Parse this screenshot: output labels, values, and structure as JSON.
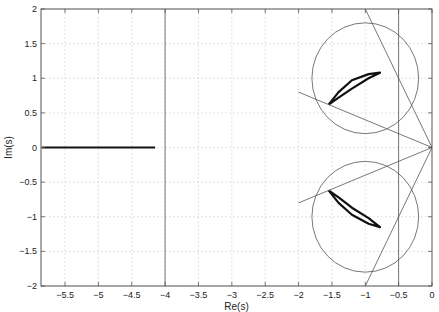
{
  "chart_data": {
    "type": "line",
    "title": "",
    "xlabel": "Re(s)",
    "ylabel": "Im(s)",
    "xlim": [
      -5.86,
      0
    ],
    "ylim": [
      -2,
      2
    ],
    "grid": true,
    "legend": null,
    "x_ticks": [
      -5.5,
      -5,
      -4.5,
      -4,
      -3.5,
      -3,
      -2.5,
      -2,
      -1.5,
      -1,
      -0.5,
      0
    ],
    "x_tick_labels": [
      "-5.5",
      "-5",
      "-4.5",
      "-4",
      "-3.5",
      "-3",
      "-2.5",
      "-2",
      "-1.5",
      "-1",
      "-0.5",
      "0"
    ],
    "y_ticks": [
      -2,
      -1.5,
      -1,
      -0.5,
      0,
      0.5,
      1,
      1.5,
      2
    ],
    "y_tick_labels": [
      "-2",
      "-1.5",
      "-1",
      "-0.5",
      "0",
      "0.5",
      "1",
      "1.5",
      "2"
    ],
    "series": [
      {
        "name": "real-axis-locus",
        "style": "thick",
        "points": [
          [
            -5.85,
            0
          ],
          [
            -4.15,
            0
          ]
        ]
      },
      {
        "name": "upper-pole-cluster",
        "style": "thick",
        "points": [
          [
            -1.55,
            0.62
          ],
          [
            -1.4,
            0.8
          ],
          [
            -1.2,
            0.97
          ],
          [
            -0.95,
            1.06
          ],
          [
            -0.78,
            1.08
          ],
          [
            -0.95,
            1.0
          ],
          [
            -1.2,
            0.85
          ],
          [
            -1.4,
            0.72
          ],
          [
            -1.55,
            0.62
          ]
        ]
      },
      {
        "name": "lower-pole-cluster",
        "style": "thick",
        "points": [
          [
            -1.55,
            -0.62
          ],
          [
            -1.4,
            -0.8
          ],
          [
            -1.2,
            -0.97
          ],
          [
            -0.95,
            -1.1
          ],
          [
            -0.78,
            -1.15
          ],
          [
            -0.95,
            -1.02
          ],
          [
            -1.2,
            -0.87
          ],
          [
            -1.4,
            -0.72
          ],
          [
            -1.55,
            -0.62
          ]
        ]
      },
      {
        "name": "vertical-bound-left",
        "style": "thin",
        "points": [
          [
            -4,
            -2
          ],
          [
            -4,
            2
          ]
        ]
      },
      {
        "name": "vertical-bound-right",
        "style": "thin",
        "points": [
          [
            -0.5,
            -2
          ],
          [
            -0.5,
            2
          ]
        ]
      },
      {
        "name": "damping-line-upper-shallow",
        "style": "thin",
        "points": [
          [
            0,
            0
          ],
          [
            -2,
            0.8
          ]
        ]
      },
      {
        "name": "damping-line-lower-shallow",
        "style": "thin",
        "points": [
          [
            0,
            0
          ],
          [
            -2,
            -0.8
          ]
        ]
      },
      {
        "name": "damping-line-upper-steep",
        "style": "thin",
        "points": [
          [
            0,
            0
          ],
          [
            -1,
            2
          ]
        ]
      },
      {
        "name": "damping-line-lower-steep",
        "style": "thin",
        "points": [
          [
            0,
            0
          ],
          [
            -1,
            -2
          ]
        ]
      }
    ],
    "circles": [
      {
        "name": "upper-region-circle",
        "center": [
          -1,
          1
        ],
        "radius": 0.8
      },
      {
        "name": "lower-region-circle",
        "center": [
          -1,
          -1
        ],
        "radius": 0.8
      }
    ],
    "plot_box_px": {
      "left": 41,
      "right": 432,
      "top": 9,
      "bottom": 286
    }
  }
}
